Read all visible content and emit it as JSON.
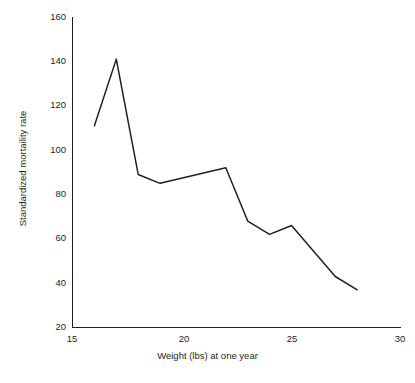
{
  "chart_data": {
    "type": "line",
    "title": "",
    "xlabel": "Weight (lbs) at one year",
    "ylabel": "Standardized mortaility rate",
    "xlim": [
      15,
      30
    ],
    "ylim": [
      20,
      160
    ],
    "xticks": [
      "15",
      "20",
      "25",
      "30"
    ],
    "xtick_values": [
      15,
      20,
      25,
      30
    ],
    "yticks": [
      "20",
      "40",
      "60",
      "80",
      "100",
      "120",
      "140",
      "160"
    ],
    "ytick_values": [
      20,
      40,
      60,
      80,
      100,
      120,
      140,
      160
    ],
    "grid": false,
    "legend": false,
    "line_color": "#231f20",
    "series": [
      {
        "name": "Standardized mortaility rate",
        "x": [
          16,
          17,
          18,
          19,
          22,
          23,
          24,
          25,
          27,
          28
        ],
        "values": [
          111,
          141,
          89,
          85,
          92,
          68,
          62,
          66,
          43,
          37
        ]
      }
    ]
  },
  "axes": {
    "x_title": "Weight (lbs) at one year",
    "y_title": "Standardized mortaility rate",
    "x_tick_labels": [
      "15",
      "20",
      "25",
      "30"
    ],
    "y_tick_labels": [
      "20",
      "40",
      "60",
      "80",
      "100",
      "120",
      "140",
      "160"
    ]
  },
  "header": {
    "title": ""
  }
}
